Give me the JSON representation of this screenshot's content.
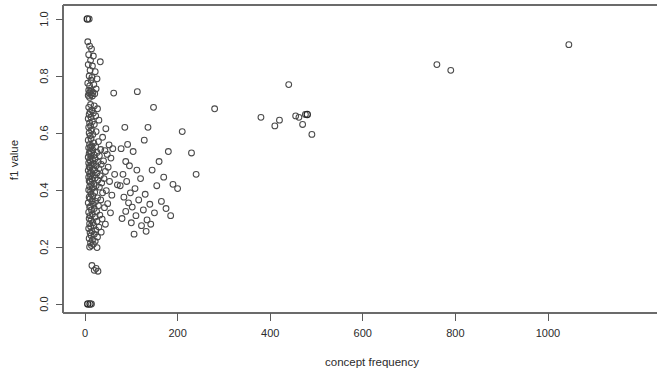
{
  "figure": {
    "name": "scatter-plot-f1-vs-concept-frequency",
    "background_color": "#ffffff",
    "marker_color": "#4a4a4a",
    "axis_color": "#5a5a5a"
  },
  "chart_data": {
    "type": "scatter",
    "title": "",
    "xlabel": "concept frequency",
    "ylabel": "f1 value",
    "xlim": [
      -25,
      1100
    ],
    "ylim": [
      -0.04,
      1.04
    ],
    "grid": false,
    "legend": null,
    "xticks": [
      "0",
      "200",
      "400",
      "600",
      "800",
      "1000"
    ],
    "xtick_values": [
      0,
      200,
      400,
      600,
      800,
      1000
    ],
    "yticks": [
      "0.0",
      "0.2",
      "0.4",
      "0.6",
      "0.8",
      "1.0"
    ],
    "ytick_values": [
      0.0,
      0.2,
      0.4,
      0.6,
      0.8,
      1.0
    ],
    "marker": "open-circle",
    "marker_size": 4,
    "points": [
      [
        5,
        1.0
      ],
      [
        9,
        1.0
      ],
      [
        6,
        0.92
      ],
      [
        10,
        0.905
      ],
      [
        14,
        0.895
      ],
      [
        8,
        0.875
      ],
      [
        18,
        0.87
      ],
      [
        12,
        0.855
      ],
      [
        33,
        0.85
      ],
      [
        7,
        0.84
      ],
      [
        16,
        0.835
      ],
      [
        11,
        0.82
      ],
      [
        22,
        0.815
      ],
      [
        9,
        0.8
      ],
      [
        15,
        0.795
      ],
      [
        26,
        0.79
      ],
      [
        13,
        0.785
      ],
      [
        6,
        0.775
      ],
      [
        19,
        0.77
      ],
      [
        10,
        0.765
      ],
      [
        24,
        0.755
      ],
      [
        8,
        0.75
      ],
      [
        14,
        0.748
      ],
      [
        11,
        0.745
      ],
      [
        17,
        0.742
      ],
      [
        9,
        0.74
      ],
      [
        21,
        0.738
      ],
      [
        13,
        0.735
      ],
      [
        7,
        0.732
      ],
      [
        16,
        0.73
      ],
      [
        62,
        0.74
      ],
      [
        10,
        0.725
      ],
      [
        12,
        0.7
      ],
      [
        20,
        0.695
      ],
      [
        8,
        0.69
      ],
      [
        27,
        0.685
      ],
      [
        15,
        0.68
      ],
      [
        11,
        0.675
      ],
      [
        18,
        0.67
      ],
      [
        9,
        0.665
      ],
      [
        23,
        0.66
      ],
      [
        13,
        0.655
      ],
      [
        7,
        0.65
      ],
      [
        30,
        0.645
      ],
      [
        16,
        0.64
      ],
      [
        10,
        0.635
      ],
      [
        20,
        0.63
      ],
      [
        12,
        0.625
      ],
      [
        8,
        0.62
      ],
      [
        45,
        0.615
      ],
      [
        14,
        0.61
      ],
      [
        24,
        0.605
      ],
      [
        9,
        0.6
      ],
      [
        17,
        0.595
      ],
      [
        11,
        0.59
      ],
      [
        38,
        0.585
      ],
      [
        13,
        0.58
      ],
      [
        7,
        0.575
      ],
      [
        29,
        0.57
      ],
      [
        19,
        0.565
      ],
      [
        10,
        0.56
      ],
      [
        52,
        0.558
      ],
      [
        15,
        0.555
      ],
      [
        23,
        0.552
      ],
      [
        12,
        0.55
      ],
      [
        8,
        0.548
      ],
      [
        60,
        0.545
      ],
      [
        34,
        0.542
      ],
      [
        17,
        0.54
      ],
      [
        43,
        0.538
      ],
      [
        11,
        0.535
      ],
      [
        26,
        0.532
      ],
      [
        14,
        0.53
      ],
      [
        9,
        0.528
      ],
      [
        48,
        0.525
      ],
      [
        20,
        0.522
      ],
      [
        31,
        0.52
      ],
      [
        13,
        0.518
      ],
      [
        7,
        0.515
      ],
      [
        56,
        0.512
      ],
      [
        22,
        0.51
      ],
      [
        16,
        0.508
      ],
      [
        10,
        0.505
      ],
      [
        40,
        0.502
      ],
      [
        12,
        0.5
      ],
      [
        28,
        0.498
      ],
      [
        8,
        0.495
      ],
      [
        18,
        0.492
      ],
      [
        35,
        0.49
      ],
      [
        14,
        0.488
      ],
      [
        24,
        0.485
      ],
      [
        9,
        0.482
      ],
      [
        50,
        0.48
      ],
      [
        11,
        0.478
      ],
      [
        30,
        0.475
      ],
      [
        16,
        0.472
      ],
      [
        21,
        0.47
      ],
      [
        7,
        0.468
      ],
      [
        44,
        0.465
      ],
      [
        13,
        0.462
      ],
      [
        26,
        0.46
      ],
      [
        10,
        0.458
      ],
      [
        64,
        0.455
      ],
      [
        18,
        0.452
      ],
      [
        33,
        0.45
      ],
      [
        12,
        0.448
      ],
      [
        8,
        0.445
      ],
      [
        22,
        0.442
      ],
      [
        41,
        0.44
      ],
      [
        15,
        0.438
      ],
      [
        28,
        0.435
      ],
      [
        9,
        0.432
      ],
      [
        53,
        0.43
      ],
      [
        11,
        0.428
      ],
      [
        36,
        0.425
      ],
      [
        19,
        0.422
      ],
      [
        14,
        0.42
      ],
      [
        70,
        0.418
      ],
      [
        24,
        0.415
      ],
      [
        10,
        0.412
      ],
      [
        31,
        0.41
      ],
      [
        16,
        0.405
      ],
      [
        8,
        0.4
      ],
      [
        46,
        0.398
      ],
      [
        12,
        0.395
      ],
      [
        21,
        0.392
      ],
      [
        38,
        0.39
      ],
      [
        13,
        0.385
      ],
      [
        58,
        0.382
      ],
      [
        17,
        0.38
      ],
      [
        9,
        0.375
      ],
      [
        27,
        0.372
      ],
      [
        11,
        0.37
      ],
      [
        34,
        0.365
      ],
      [
        15,
        0.362
      ],
      [
        23,
        0.36
      ],
      [
        7,
        0.355
      ],
      [
        49,
        0.352
      ],
      [
        18,
        0.35
      ],
      [
        29,
        0.345
      ],
      [
        12,
        0.342
      ],
      [
        10,
        0.34
      ],
      [
        42,
        0.338
      ],
      [
        20,
        0.335
      ],
      [
        14,
        0.33
      ],
      [
        25,
        0.325
      ],
      [
        8,
        0.322
      ],
      [
        55,
        0.32
      ],
      [
        16,
        0.315
      ],
      [
        32,
        0.312
      ],
      [
        11,
        0.31
      ],
      [
        22,
        0.305
      ],
      [
        9,
        0.3
      ],
      [
        37,
        0.298
      ],
      [
        13,
        0.295
      ],
      [
        26,
        0.29
      ],
      [
        17,
        0.285
      ],
      [
        10,
        0.282
      ],
      [
        44,
        0.28
      ],
      [
        19,
        0.275
      ],
      [
        12,
        0.272
      ],
      [
        30,
        0.27
      ],
      [
        8,
        0.265
      ],
      [
        23,
        0.26
      ],
      [
        15,
        0.255
      ],
      [
        35,
        0.252
      ],
      [
        11,
        0.25
      ],
      [
        20,
        0.245
      ],
      [
        13,
        0.24
      ],
      [
        27,
        0.235
      ],
      [
        9,
        0.23
      ],
      [
        16,
        0.225
      ],
      [
        22,
        0.22
      ],
      [
        12,
        0.215
      ],
      [
        18,
        0.21
      ],
      [
        14,
        0.205
      ],
      [
        10,
        0.2
      ],
      [
        26,
        0.198
      ],
      [
        15,
        0.135
      ],
      [
        24,
        0.125
      ],
      [
        20,
        0.118
      ],
      [
        28,
        0.115
      ],
      [
        6,
        0.0
      ],
      [
        11,
        0.0
      ],
      [
        14,
        0.0
      ],
      [
        86,
        0.62
      ],
      [
        92,
        0.56
      ],
      [
        78,
        0.545
      ],
      [
        104,
        0.535
      ],
      [
        88,
        0.5
      ],
      [
        96,
        0.485
      ],
      [
        112,
        0.47
      ],
      [
        82,
        0.455
      ],
      [
        120,
        0.44
      ],
      [
        90,
        0.43
      ],
      [
        76,
        0.415
      ],
      [
        108,
        0.405
      ],
      [
        98,
        0.39
      ],
      [
        130,
        0.385
      ],
      [
        84,
        0.375
      ],
      [
        116,
        0.365
      ],
      [
        94,
        0.355
      ],
      [
        140,
        0.35
      ],
      [
        102,
        0.34
      ],
      [
        126,
        0.33
      ],
      [
        88,
        0.325
      ],
      [
        150,
        0.32
      ],
      [
        110,
        0.31
      ],
      [
        80,
        0.3
      ],
      [
        134,
        0.295
      ],
      [
        100,
        0.285
      ],
      [
        160,
        0.5
      ],
      [
        170,
        0.445
      ],
      [
        180,
        0.535
      ],
      [
        145,
        0.47
      ],
      [
        155,
        0.415
      ],
      [
        190,
        0.42
      ],
      [
        200,
        0.405
      ],
      [
        165,
        0.36
      ],
      [
        175,
        0.335
      ],
      [
        185,
        0.31
      ],
      [
        142,
        0.28
      ],
      [
        122,
        0.275
      ],
      [
        132,
        0.255
      ],
      [
        106,
        0.245
      ],
      [
        113,
        0.745
      ],
      [
        148,
        0.69
      ],
      [
        136,
        0.62
      ],
      [
        128,
        0.575
      ],
      [
        210,
        0.605
      ],
      [
        230,
        0.53
      ],
      [
        240,
        0.455
      ],
      [
        280,
        0.685
      ],
      [
        380,
        0.655
      ],
      [
        410,
        0.625
      ],
      [
        420,
        0.645
      ],
      [
        440,
        0.77
      ],
      [
        455,
        0.66
      ],
      [
        462,
        0.655
      ],
      [
        470,
        0.63
      ],
      [
        476,
        0.665
      ],
      [
        480,
        0.665
      ],
      [
        490,
        0.595
      ],
      [
        760,
        0.84
      ],
      [
        790,
        0.82
      ],
      [
        1045,
        0.91
      ]
    ],
    "dense_overlap_points": [
      [
        5,
        1.0
      ],
      [
        6,
        0.0
      ],
      [
        11,
        0.0
      ],
      [
        480,
        0.665
      ]
    ]
  },
  "axes": {
    "x_axis": {
      "label": "concept frequency"
    },
    "y_axis": {
      "label": "f1 value"
    }
  }
}
